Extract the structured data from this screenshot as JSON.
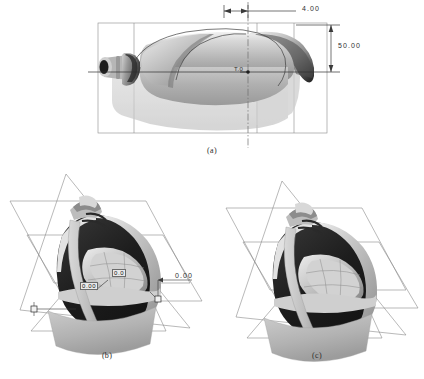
{
  "figure": {
    "background_color": "#ffffff",
    "ink_color": "#303030",
    "panels": [
      {
        "id": "a",
        "caption": "(a)",
        "view": "side elevation / orthographic projection of blow-moulded bottle with centreline and bounding construction box",
        "annotations": [
          {
            "name": "wall-thickness-dimension",
            "value": "4.00",
            "placement": "top",
            "type": "linear"
          },
          {
            "name": "height-dimension",
            "value": "50.00",
            "placement": "right",
            "type": "linear"
          },
          {
            "name": "centre-thickness-marker",
            "value": "T.0",
            "placement": "centre",
            "type": "leader"
          }
        ]
      },
      {
        "id": "b",
        "caption": "(b)",
        "view": "isometric 3D view of bottle with intersecting construction datum planes and zero-offset dimensions",
        "annotations": [
          {
            "name": "left-offset-dimension",
            "value": "0.00",
            "placement": "inner-left",
            "type": "boxed"
          },
          {
            "name": "mid-offset-dimension",
            "value": "0.0",
            "placement": "inner-mid",
            "type": "boxed"
          },
          {
            "name": "right-offset-dimension",
            "value": "0.00",
            "placement": "outer-right",
            "type": "leader"
          }
        ]
      },
      {
        "id": "c",
        "caption": "(c)",
        "view": "isometric 3D view of bottle with intersecting construction datum planes, dimensions suppressed",
        "annotations": []
      }
    ],
    "palette": {
      "line": "#5a5a5a",
      "plane_edge": "#7a7a7a",
      "body_light": "#cfcfcf",
      "body_mid": "#a9a9a9",
      "body_dark": "#7d7d7d",
      "body_shadow": "#4a4a4a",
      "body_black": "#1b1b1b",
      "highlight": "#efefef",
      "dim_line": "#3a3a3a"
    }
  }
}
